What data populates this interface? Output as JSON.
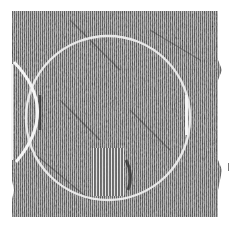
{
  "image": {
    "description": "Dithered grayscale noisy texture with a large circular outline, a lens-shaped arc at left, a short vertical bright stripe at right, and a vertically striped patch near the bottom center",
    "colors": {
      "background": "#ffffff",
      "texture_dark": "#3a3a3a",
      "texture_mid": "#8a8a8a",
      "texture_light": "#c8c8c8",
      "outline": "#f2f2f2"
    },
    "block": {
      "x": 12,
      "y": 11,
      "width": 207,
      "height": 206
    },
    "circle": {
      "cx": 108,
      "cy": 118,
      "r": 82
    },
    "left_lens": {
      "x": 12,
      "y": 62,
      "width": 40,
      "height": 100
    },
    "right_stripe": {
      "x": 185,
      "y": 95,
      "width": 3,
      "height": 40
    },
    "bottom_patch": {
      "x": 92,
      "y": 148,
      "width": 32,
      "height": 48
    }
  }
}
